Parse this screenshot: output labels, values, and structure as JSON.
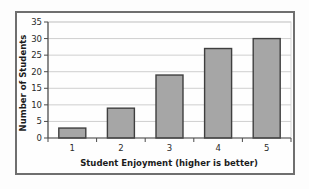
{
  "chart_data": {
    "type": "bar",
    "title": "",
    "categories": [
      "1",
      "2",
      "3",
      "4",
      "5"
    ],
    "values": [
      3,
      9,
      19,
      27,
      30
    ],
    "xlabel": "Student Enjoyment (higher is better)",
    "ylabel": "Number of Students",
    "ylim": [
      0,
      35
    ],
    "yticks": [
      0,
      5,
      10,
      15,
      20,
      25,
      30,
      35
    ],
    "grid": "horizontal-only",
    "legend": "none",
    "colors": {
      "bar_fill": "#a6a6a6",
      "bar_border": "#3f3f3f",
      "gridline": "#cfcfcf",
      "plot_border": "#d9d9d9",
      "axis_line": "#4a4a4a",
      "frame_border": "#6f6f6f",
      "text": "#1c1c1c",
      "plot_background": "#fefefe"
    }
  }
}
